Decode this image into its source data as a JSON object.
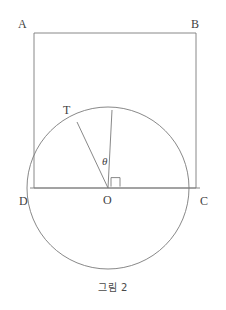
{
  "figure": {
    "caption": "그림 2",
    "stroke_color": "#7b7b7b",
    "label_color": "#3f3f3f",
    "background_color": "#ffffff",
    "labels": {
      "A": "A",
      "B": "B",
      "C": "C",
      "D": "D",
      "O": "O",
      "T": "T",
      "theta": "θ"
    },
    "geometry": {
      "rectangle": {
        "left": 34,
        "top": 33,
        "right": 196,
        "bottom": 188,
        "width": 162,
        "height": 155
      },
      "circle": {
        "center_x": 108,
        "center_y": 188,
        "radius": 81
      },
      "chord_DC": {
        "x1": 34,
        "y1": 188,
        "x2": 196,
        "y2": 188
      },
      "radius_vertical": {
        "x1": 108,
        "y1": 188,
        "x2": 112,
        "y2": 110
      },
      "radius_OT": {
        "x1": 108,
        "y1": 188,
        "x2": 77,
        "y2": 122
      },
      "right_angle_marker": {
        "x": 112,
        "y": 177,
        "size": 9
      }
    },
    "label_positions": {
      "A": {
        "x": 18,
        "y": 18
      },
      "B": {
        "x": 191,
        "y": 18
      },
      "C": {
        "x": 200,
        "y": 195
      },
      "D": {
        "x": 19,
        "y": 195
      },
      "O": {
        "x": 103,
        "y": 194
      },
      "T": {
        "x": 63,
        "y": 104
      },
      "theta": {
        "x": 102,
        "y": 156
      }
    }
  }
}
